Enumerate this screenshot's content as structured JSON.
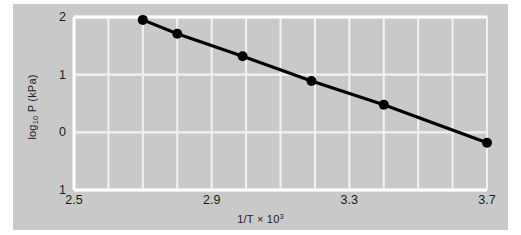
{
  "figure": {
    "background_color": "#ffffff",
    "plate_color": "#c9c9c9",
    "grid_color": "#f2f2f2",
    "axis_color": "#ffffff",
    "series_color": "#000000",
    "text_color": "#1b1b1b"
  },
  "chart_data": {
    "type": "line",
    "title": "",
    "subtitle": "",
    "xlabel": "1/T × 10³",
    "ylabel": "log₁₀ P (kPa)",
    "xlim": [
      2.5,
      3.7
    ],
    "ylim": [
      -1,
      2
    ],
    "grid": true,
    "legend": "none",
    "x_tick_labels": [
      "2.5",
      "2.9",
      "3.3",
      "3.7"
    ],
    "x_tick_values": [
      2.5,
      2.9,
      3.3,
      3.7
    ],
    "x_minor_step": 0.1,
    "y_tick_labels": [
      "2",
      "1",
      "0",
      "1"
    ],
    "y_tick_values": [
      2,
      1,
      0,
      -1
    ],
    "marker": "filled-circle",
    "series": [
      {
        "name": "log10 P vs 1/T",
        "x": [
          2.7,
          2.8,
          2.99,
          3.19,
          3.4,
          3.7
        ],
        "y": [
          1.95,
          1.71,
          1.32,
          0.89,
          0.48,
          -0.18
        ]
      }
    ]
  },
  "labels": {
    "x_axis_title_main": "1/T",
    "x_axis_title_times": "×",
    "x_axis_title_base": "10",
    "x_axis_title_exponent": "3",
    "y_axis_title_prefix": "log",
    "y_axis_title_subscript": "10",
    "y_axis_title_suffix": " P (kPa)"
  }
}
